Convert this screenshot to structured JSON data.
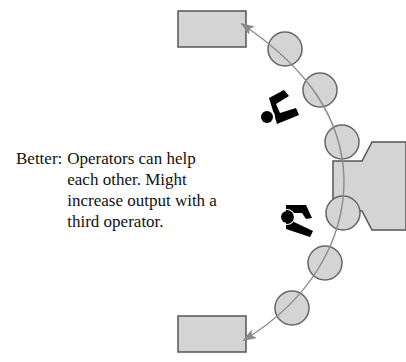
{
  "caption": {
    "label": "Better:",
    "text": "Operators can help each other. Might increase output with a third operator."
  },
  "diagram": {
    "type": "U-shaped work cell layout",
    "elements": {
      "input_box": "rectangle-top",
      "output_box": "rectangle-bottom",
      "machine": "central machine",
      "stations": 6,
      "operators": 2
    },
    "colors": {
      "fill": "#d4d4d4",
      "stroke": "#555555",
      "flow_line": "#8a8a8a",
      "operator": "#000000"
    }
  }
}
